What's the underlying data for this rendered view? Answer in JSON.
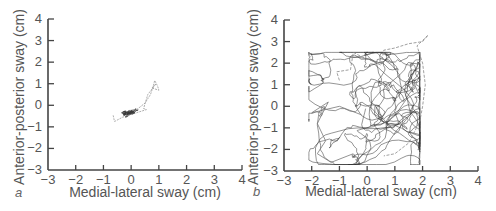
{
  "chart_data": [
    {
      "type": "line",
      "panel_label": "a",
      "title": "",
      "xlabel": "Medial-lateral sway (cm)",
      "ylabel": "Anterior-posterior sway (cm)",
      "xlim": [
        -3,
        4
      ],
      "ylim": [
        -3,
        4
      ],
      "xticks": [
        "−3",
        "−2",
        "−1",
        "0",
        "1",
        "2",
        "3",
        "4"
      ],
      "yticks": [
        "−3",
        "−2",
        "−1",
        "0",
        "1",
        "2",
        "3",
        "4"
      ],
      "grid": false,
      "legend": null,
      "description": "Center-of-pressure sway trajectory, small and concentrated near origin, elongated along positive diagonal",
      "series": [
        {
          "name": "sway path",
          "x": [
            -0.6,
            -0.4,
            -0.2,
            0.0,
            0.2,
            0.4,
            0.5,
            0.6,
            0.7,
            0.8,
            0.9,
            0.7,
            0.5,
            0.3,
            0.1,
            -0.1,
            -0.3,
            -0.5
          ],
          "y": [
            -0.5,
            -0.4,
            -0.3,
            -0.2,
            -0.1,
            0.0,
            0.2,
            0.5,
            0.8,
            1.1,
            0.7,
            0.3,
            -0.1,
            -0.2,
            -0.3,
            -0.4,
            -0.5,
            -0.6
          ]
        }
      ],
      "extent": {
        "x_min": -0.7,
        "x_max": 1.0,
        "y_min": -0.8,
        "y_max": 1.2
      }
    },
    {
      "type": "line",
      "panel_label": "b",
      "title": "",
      "xlabel": "Medial-lateral sway (cm)",
      "ylabel": "Anterior-posterior sway (cm)",
      "xlim": [
        -3,
        4
      ],
      "ylim": [
        -3,
        4
      ],
      "xticks": [
        "−3",
        "−2",
        "−1",
        "0",
        "1",
        "2",
        "3",
        "4"
      ],
      "yticks": [
        "−3",
        "−2",
        "−1",
        "0",
        "1",
        "2",
        "3",
        "4"
      ],
      "grid": false,
      "legend": null,
      "description": "Center-of-pressure sway trajectory, large dense cluster around origin with excursions to upper right",
      "series": [
        {
          "name": "sway path",
          "x": [
            -2.0,
            -1.5,
            -1.0,
            -0.5,
            0.0,
            0.5,
            1.0,
            1.5,
            2.0,
            2.2,
            1.8,
            1.2,
            0.6,
            0.0,
            -0.6,
            -1.2,
            -1.6
          ],
          "y": [
            -0.3,
            0.5,
            1.2,
            2.5,
            2.3,
            1.8,
            1.2,
            0.3,
            -0.6,
            3.3,
            2.0,
            -1.5,
            -2.2,
            -2.5,
            -2.3,
            -2.6,
            -2.0
          ]
        }
      ],
      "extent": {
        "x_min": -2.1,
        "x_max": 2.3,
        "y_min": -2.7,
        "y_max": 3.4
      }
    }
  ],
  "panels": [
    {
      "label": "a",
      "xlabel": "Medial-lateral sway (cm)",
      "ylabel": "Anterior-posterior sway (cm)",
      "xticks": [
        "−3",
        "−2",
        "−1",
        "0",
        "1",
        "2",
        "3",
        "4"
      ],
      "yticks": [
        "−3",
        "−2",
        "−1",
        "0",
        "1",
        "2",
        "3",
        "4"
      ]
    },
    {
      "label": "b",
      "xlabel": "Medial-lateral sway (cm)",
      "ylabel": "Anterior-posterior sway (cm)",
      "xticks": [
        "−3",
        "−2",
        "−1",
        "0",
        "1",
        "2",
        "3",
        "4"
      ],
      "yticks": [
        "−3",
        "−2",
        "−1",
        "0",
        "1",
        "2",
        "3",
        "4"
      ]
    }
  ],
  "colors": {
    "axis": "#444444",
    "trace": "#3a3a3a",
    "text": "#555555"
  }
}
